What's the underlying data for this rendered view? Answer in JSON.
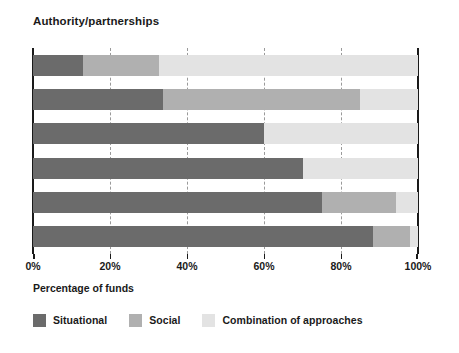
{
  "chart_data": {
    "type": "bar",
    "subtype": "stacked-horizontal-100pct",
    "title": "Authority/partnerships",
    "xlabel": "Percentage of funds",
    "ylabel": "",
    "xlim": [
      0,
      100
    ],
    "xticks": [
      0,
      20,
      40,
      60,
      80,
      100
    ],
    "xtick_labels": [
      "0%",
      "20%",
      "40%",
      "60%",
      "80%",
      "100%"
    ],
    "grid": true,
    "grid_axis": "x",
    "grid_style": "dashed",
    "legend_position": "below",
    "categories": [
      "Bar 1",
      "Bar 2",
      "Bar 3",
      "Bar 4",
      "Bar 5",
      "Bar 6"
    ],
    "series": [
      {
        "name": "Situational",
        "color": "#6b6b6b",
        "values": [
          13.0,
          33.7,
          60.0,
          70.0,
          75.0,
          88.2
        ]
      },
      {
        "name": "Social",
        "color": "#b0b0b0",
        "values": [
          19.6,
          51.3,
          0.0,
          0.0,
          19.3,
          9.7
        ]
      },
      {
        "name": "Combination of approaches",
        "color": "#e3e3e3",
        "values": [
          67.4,
          15.0,
          40.0,
          30.0,
          5.7,
          2.1
        ]
      }
    ]
  },
  "colors": {
    "situational": "#6b6b6b",
    "social": "#b0b0b0",
    "combination": "#e3e3e3",
    "axis": "#1a1a1a",
    "gridline": "#9a9a9a",
    "background": "#ffffff"
  }
}
